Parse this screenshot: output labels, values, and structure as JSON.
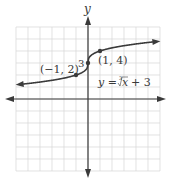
{
  "chart_data": {
    "type": "line",
    "title": "",
    "xlabel": "",
    "ylabel": "y",
    "equation_label": "y = ∛x + 3",
    "equation": {
      "lhs": "y =",
      "root_index": "3",
      "radicand": "x",
      "rest": "+ 3"
    },
    "xlim": [
      -6,
      6
    ],
    "ylim": [
      -6,
      6
    ],
    "grid": true,
    "grid_step": 1,
    "series": [
      {
        "name": "y = ∛x + 3",
        "function": "cbrt(x) + 3",
        "x_range": [
          -5.7,
          5.7
        ],
        "arrows_both_ends": true
      }
    ],
    "points": [
      {
        "x": -1,
        "y": 2,
        "label": "(−1, 2)"
      },
      {
        "x": 0,
        "y": 3,
        "label": "3"
      },
      {
        "x": 1,
        "y": 4,
        "label": "(1, 4)"
      }
    ]
  },
  "colors": {
    "grid": "#d6d6d6",
    "axis": "#3a3a3a",
    "curve": "#3a3a3a",
    "background": "#ffffff"
  }
}
